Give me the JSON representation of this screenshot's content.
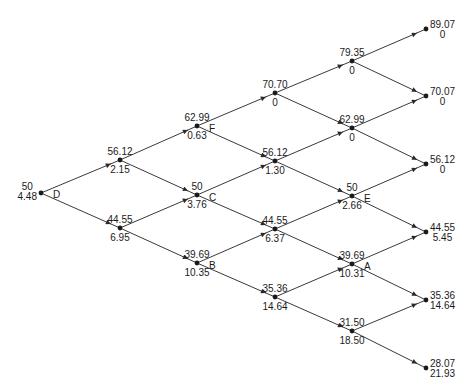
{
  "diagram": {
    "type": "binomial-tree",
    "colors": {
      "line": "#3a3a3a",
      "node": "#1a1a1a",
      "text": "#1a1a1a",
      "background": "#ffffff"
    },
    "nodes": [
      {
        "id": "n0_0",
        "x": 41,
        "y": 193,
        "price": "50",
        "value": "4.48",
        "tag": "D",
        "kind": "root"
      },
      {
        "id": "n1_0",
        "x": 120,
        "y": 160,
        "price": "56.12",
        "value": "2.15",
        "tag": ""
      },
      {
        "id": "n1_1",
        "x": 120,
        "y": 228,
        "price": "44.55",
        "value": "6.95",
        "tag": ""
      },
      {
        "id": "n2_0",
        "x": 197,
        "y": 126,
        "price": "62.99",
        "value": "0.63",
        "tag": "F"
      },
      {
        "id": "n2_1",
        "x": 197,
        "y": 195,
        "price": "50",
        "value": "3.76",
        "tag": "C"
      },
      {
        "id": "n2_2",
        "x": 197,
        "y": 263,
        "price": "39.69",
        "value": "10.35",
        "tag": "B"
      },
      {
        "id": "n3_0",
        "x": 275,
        "y": 93,
        "price": "70.70",
        "value": "0",
        "tag": ""
      },
      {
        "id": "n3_1",
        "x": 275,
        "y": 161,
        "price": "56.12",
        "value": "1.30",
        "tag": ""
      },
      {
        "id": "n3_2",
        "x": 275,
        "y": 229,
        "price": "44.55",
        "value": "6.37",
        "tag": ""
      },
      {
        "id": "n3_3",
        "x": 275,
        "y": 297,
        "price": "35.36",
        "value": "14.64",
        "tag": ""
      },
      {
        "id": "n4_0",
        "x": 352,
        "y": 61,
        "price": "79.35",
        "value": "0",
        "tag": ""
      },
      {
        "id": "n4_1",
        "x": 352,
        "y": 128,
        "price": "62.99",
        "value": "0",
        "tag": ""
      },
      {
        "id": "n4_2",
        "x": 352,
        "y": 196,
        "price": "50",
        "value": "2.66",
        "tag": "E"
      },
      {
        "id": "n4_3",
        "x": 352,
        "y": 264,
        "price": "39.69",
        "value": "10.31",
        "tag": "A"
      },
      {
        "id": "n4_4",
        "x": 352,
        "y": 331,
        "price": "31.50",
        "value": "18.50",
        "tag": ""
      },
      {
        "id": "n5_0",
        "x": 426,
        "y": 29,
        "price": "89.07",
        "value": "0",
        "tag": "",
        "kind": "leaf"
      },
      {
        "id": "n5_1",
        "x": 426,
        "y": 96,
        "price": "70.07",
        "value": "0",
        "tag": "",
        "kind": "leaf"
      },
      {
        "id": "n5_2",
        "x": 426,
        "y": 164,
        "price": "56.12",
        "value": "0",
        "tag": "",
        "kind": "leaf"
      },
      {
        "id": "n5_3",
        "x": 426,
        "y": 232,
        "price": "44.55",
        "value": "5.45",
        "tag": "",
        "kind": "leaf"
      },
      {
        "id": "n5_4",
        "x": 426,
        "y": 300,
        "price": "35.36",
        "value": "14.64",
        "tag": "",
        "kind": "leaf"
      },
      {
        "id": "n5_5",
        "x": 426,
        "y": 368,
        "price": "28.07",
        "value": "21.93",
        "tag": "",
        "kind": "leaf"
      }
    ],
    "edges": [
      [
        "n0_0",
        "n1_0"
      ],
      [
        "n0_0",
        "n1_1"
      ],
      [
        "n1_0",
        "n2_0"
      ],
      [
        "n1_0",
        "n2_1"
      ],
      [
        "n1_1",
        "n2_1"
      ],
      [
        "n1_1",
        "n2_2"
      ],
      [
        "n2_0",
        "n3_0"
      ],
      [
        "n2_0",
        "n3_1"
      ],
      [
        "n2_1",
        "n3_1"
      ],
      [
        "n2_1",
        "n3_2"
      ],
      [
        "n2_2",
        "n3_2"
      ],
      [
        "n2_2",
        "n3_3"
      ],
      [
        "n3_0",
        "n4_0"
      ],
      [
        "n3_0",
        "n4_1"
      ],
      [
        "n3_1",
        "n4_1"
      ],
      [
        "n3_1",
        "n4_2"
      ],
      [
        "n3_2",
        "n4_2"
      ],
      [
        "n3_2",
        "n4_3"
      ],
      [
        "n3_3",
        "n4_3"
      ],
      [
        "n3_3",
        "n4_4"
      ],
      [
        "n4_0",
        "n5_0"
      ],
      [
        "n4_0",
        "n5_1"
      ],
      [
        "n4_1",
        "n5_1"
      ],
      [
        "n4_1",
        "n5_2"
      ],
      [
        "n4_2",
        "n5_2"
      ],
      [
        "n4_2",
        "n5_3"
      ],
      [
        "n4_3",
        "n5_3"
      ],
      [
        "n4_3",
        "n5_4"
      ],
      [
        "n4_4",
        "n5_4"
      ],
      [
        "n4_4",
        "n5_5"
      ]
    ]
  }
}
